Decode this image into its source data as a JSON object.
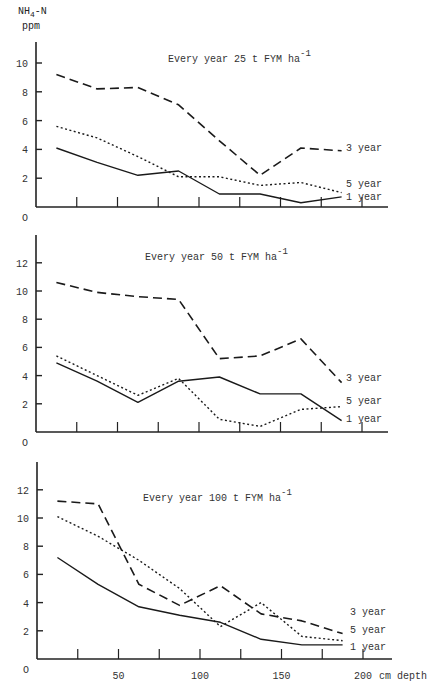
{
  "figure": {
    "y_axis_label": "NH4-N",
    "y_axis_unit": "ppm",
    "x_axis_unit_label": "cm depth"
  },
  "chart_data": [
    {
      "type": "line",
      "title": "Every year 25 t FYM ha-1",
      "xlabel": "cm depth",
      "ylabel": "NH4-N ppm",
      "x": [
        12.5,
        37.5,
        62.5,
        87.5,
        112.5,
        137.5,
        162.5,
        187.5
      ],
      "xlim": [
        0,
        210
      ],
      "ylim": [
        0,
        11
      ],
      "yticks": [
        0,
        2,
        4,
        6,
        8,
        10
      ],
      "xticks": [
        25,
        50,
        75,
        100,
        125,
        150,
        175,
        200
      ],
      "xtick_labels_shown": false,
      "series": [
        {
          "name": "3 year",
          "style": "dashed",
          "values": [
            9.2,
            8.2,
            8.3,
            7.1,
            4.6,
            2.2,
            4.1,
            3.9
          ]
        },
        {
          "name": "5 year",
          "style": "dotted",
          "values": [
            5.6,
            4.8,
            3.5,
            2.1,
            2.1,
            1.5,
            1.7,
            1.0
          ]
        },
        {
          "name": "1 year",
          "style": "solid",
          "values": [
            4.1,
            3.1,
            2.2,
            2.5,
            0.9,
            0.9,
            0.3,
            0.7
          ]
        }
      ],
      "legend_position": "right, inline at line ends"
    },
    {
      "type": "line",
      "title": "Every year 50 t FYM ha-1",
      "xlabel": "cm depth",
      "ylabel": "NH4-N ppm",
      "x": [
        12.5,
        37.5,
        62.5,
        87.5,
        112.5,
        137.5,
        162.5,
        187.5
      ],
      "xlim": [
        0,
        210
      ],
      "ylim": [
        0,
        14
      ],
      "yticks": [
        0,
        2,
        4,
        6,
        8,
        10,
        12
      ],
      "xticks": [
        25,
        50,
        75,
        100,
        125,
        150,
        175,
        200
      ],
      "xtick_labels_shown": false,
      "series": [
        {
          "name": "3 year",
          "style": "dashed",
          "values": [
            10.6,
            9.9,
            9.6,
            9.4,
            5.2,
            5.4,
            6.6,
            3.5
          ]
        },
        {
          "name": "5 year",
          "style": "dotted",
          "values": [
            5.4,
            4.0,
            2.6,
            3.8,
            0.9,
            0.4,
            1.6,
            1.8
          ]
        },
        {
          "name": "1 year",
          "style": "solid",
          "values": [
            4.9,
            3.6,
            2.1,
            3.6,
            3.9,
            2.7,
            2.7,
            0.8
          ]
        }
      ],
      "legend_position": "right, inline at line ends"
    },
    {
      "type": "line",
      "title": "Every year 100 t FYM ha-1",
      "xlabel": "cm depth",
      "ylabel": "NH4-N ppm",
      "x": [
        12.5,
        37.5,
        62.5,
        87.5,
        112.5,
        137.5,
        162.5,
        187.5
      ],
      "xlim": [
        0,
        210
      ],
      "ylim": [
        0,
        14
      ],
      "yticks": [
        0,
        2,
        4,
        6,
        8,
        10,
        12
      ],
      "xticks": [
        25,
        50,
        75,
        100,
        125,
        150,
        175,
        200
      ],
      "xtick_labels": [
        "50",
        "100",
        "150",
        "200"
      ],
      "xtick_labels_shown": true,
      "series": [
        {
          "name": "3 year",
          "style": "dashed",
          "values": [
            11.2,
            11.0,
            5.3,
            3.8,
            5.2,
            3.2,
            2.7,
            1.8
          ]
        },
        {
          "name": "5 year",
          "style": "dotted",
          "values": [
            10.1,
            8.7,
            7.0,
            5.0,
            2.3,
            4.0,
            1.6,
            1.3
          ]
        },
        {
          "name": "1 year",
          "style": "solid",
          "values": [
            7.2,
            5.3,
            3.7,
            3.1,
            2.6,
            1.4,
            1.0,
            1.0
          ]
        }
      ],
      "legend_position": "right, inline at line ends"
    }
  ],
  "panels_layout": [
    {
      "axis_x": 36,
      "x0": 36,
      "px_per_cm": 1.63,
      "y0": 207,
      "px_per_unit": 14.4,
      "y_top": 42,
      "x_end": 388,
      "title_x": 168,
      "title_y": 62,
      "tick_len": 10,
      "legend": [
        {
          "label": "3 year",
          "y": 151
        },
        {
          "label": "5 year",
          "y": 187
        },
        {
          "label": "1 year",
          "y": 200
        }
      ]
    },
    {
      "axis_x": 36,
      "x0": 36,
      "px_per_cm": 1.63,
      "y0": 432,
      "px_per_unit": 14.1,
      "y_top": 235,
      "x_end": 388,
      "title_x": 145,
      "title_y": 260,
      "tick_len": 10,
      "legend": [
        {
          "label": "3 year",
          "y": 381
        },
        {
          "label": "5 year",
          "y": 404
        },
        {
          "label": "1 year",
          "y": 422
        }
      ]
    },
    {
      "axis_x": 37,
      "x0": 37,
      "px_per_cm": 1.63,
      "y0": 659,
      "px_per_unit": 14.1,
      "y_top": 462,
      "x_end": 392,
      "title_x": 143,
      "title_y": 501,
      "tick_len": 10,
      "legend": [
        {
          "label": "3 year",
          "y": 615
        },
        {
          "label": "5 year",
          "y": 633
        },
        {
          "label": "1 year",
          "y": 650
        }
      ]
    }
  ]
}
